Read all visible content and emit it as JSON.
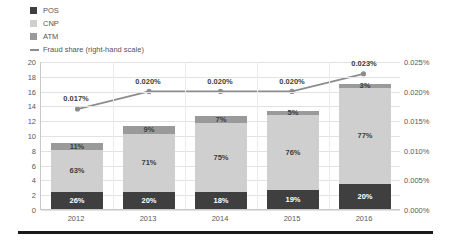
{
  "legend": {
    "items": [
      {
        "label": "POS",
        "color": "#3f3f3f",
        "marker": "square"
      },
      {
        "label": "CNP",
        "color": "#cfcfcf",
        "marker": "square"
      },
      {
        "label": "ATM",
        "color": "#9a9a9a",
        "marker": "square"
      },
      {
        "label": "Fraud share (right-hand scale)",
        "color": "#8c8c8c",
        "marker": "line"
      }
    ]
  },
  "chart_data": {
    "type": "bar",
    "title": "",
    "xlabel": "",
    "ylabel": "",
    "categories": [
      "2012",
      "2013",
      "2014",
      "2015",
      "2016"
    ],
    "stacked": true,
    "grid": true,
    "legend_position": "top-left",
    "ylim": [
      0,
      20
    ],
    "y_ticks": [
      0,
      2,
      4,
      6,
      8,
      10,
      12,
      14,
      16,
      18,
      20
    ],
    "y_tick_labels": [
      "0",
      "2",
      "4",
      "6",
      "8",
      "10",
      "12",
      "14",
      "16",
      "18",
      "20"
    ],
    "y2lim": [
      0,
      0.025
    ],
    "y2_ticks": [
      0,
      0.005,
      0.01,
      0.015,
      0.02,
      0.025
    ],
    "y2_tick_labels": [
      "0.000%",
      "0.005%",
      "0.010%",
      "0.015%",
      "0.020%",
      "0.025%"
    ],
    "totals": [
      8.9,
      11.2,
      12.5,
      13.3,
      16.9
    ],
    "series": [
      {
        "name": "POS",
        "color": "#3f3f3f",
        "values": [
          2.31,
          2.24,
          2.25,
          2.53,
          3.38
        ],
        "labels": [
          "26%",
          "20%",
          "18%",
          "19%",
          "20%"
        ]
      },
      {
        "name": "CNP",
        "color": "#cfcfcf",
        "values": [
          5.61,
          7.95,
          9.38,
          10.11,
          13.01
        ],
        "labels": [
          "63%",
          "71%",
          "75%",
          "76%",
          "77%"
        ]
      },
      {
        "name": "ATM",
        "color": "#9a9a9a",
        "values": [
          0.98,
          1.01,
          0.88,
          0.67,
          0.51
        ],
        "labels": [
          "11%",
          "9%",
          "7%",
          "5%",
          "3%"
        ]
      }
    ],
    "line_series": {
      "name": "Fraud share (right-hand scale)",
      "color": "#8c8c8c",
      "axis": "right",
      "values": [
        0.017,
        0.02,
        0.02,
        0.02,
        0.023
      ],
      "labels": [
        "0.017%",
        "0.020%",
        "0.020%",
        "0.020%",
        "0.023%"
      ]
    }
  }
}
